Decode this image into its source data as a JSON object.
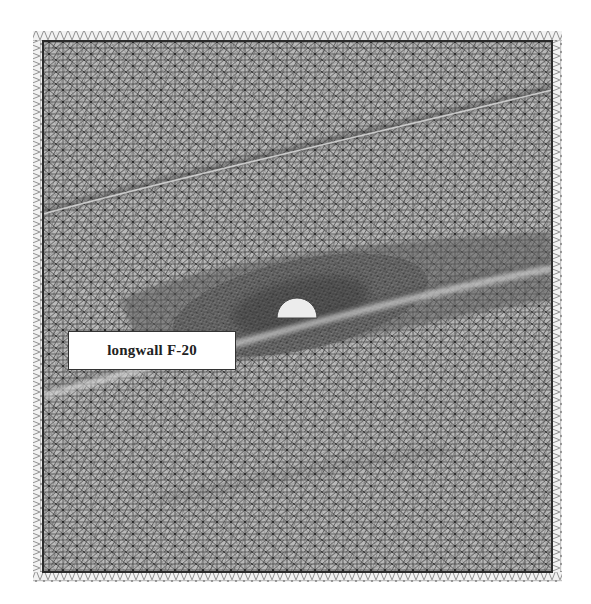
{
  "figure": {
    "type": "finite-element triangular mesh",
    "label": "longwall F-20",
    "colors": {
      "background": "#ffffff",
      "mesh_fill": "#b8b8b8",
      "mesh_line": "#3a3a3a",
      "dense_zone": "#4a4a4a",
      "boundary_line": "#2a2a2a",
      "opening_fill": "#ececec",
      "seam_highlight": "#d8d8d8"
    },
    "geometry": {
      "outer_band": {
        "x": 33,
        "y": 31,
        "w": 529,
        "h": 551
      },
      "inner_domain": {
        "x": 43,
        "y": 41,
        "w": 509,
        "h": 531
      },
      "opening": {
        "cx": 297,
        "cy": 316,
        "r": 20,
        "shape": "semicircle"
      },
      "label_box": {
        "x": 68,
        "y": 331,
        "w": 168,
        "h": 39
      }
    }
  }
}
